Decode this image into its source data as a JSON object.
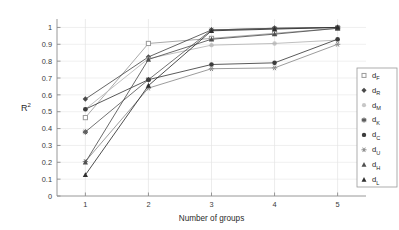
{
  "chart_data": {
    "type": "line",
    "title": "",
    "xlabel": "Number of groups",
    "ylabel": "R^2",
    "ylabel_base": "R",
    "ylabel_exp": "2",
    "x": [
      1,
      2,
      3,
      4,
      5
    ],
    "xticklabels": [
      "1",
      "2",
      "3",
      "4",
      "5"
    ],
    "yticklabels": [
      "0",
      "0.1",
      "0.2",
      "0.3",
      "0.4",
      "0.5",
      "0.6",
      "0.7",
      "0.8",
      "0.9",
      "1"
    ],
    "yticks": [
      0,
      0.1,
      0.2,
      0.3,
      0.4,
      0.5,
      0.6,
      0.7,
      0.8,
      0.9,
      1.0
    ],
    "xlim": [
      0.55,
      5.45
    ],
    "ylim": [
      0,
      1.05
    ],
    "grid": true,
    "legend_position": "right-inside",
    "series": [
      {
        "name": "d_F",
        "label_base": "d",
        "label_sub": "F",
        "marker": "square",
        "color": "#9a9a9a",
        "values": [
          0.465,
          0.905,
          0.935,
          0.965,
          0.995
        ]
      },
      {
        "name": "d_R",
        "label_base": "d",
        "label_sub": "R",
        "marker": "diamond",
        "color": "#4a4a4a",
        "values": [
          0.575,
          0.825,
          0.985,
          0.995,
          1.0
        ]
      },
      {
        "name": "d_M",
        "label_base": "d",
        "label_sub": "M",
        "marker": "circle-open",
        "color": "#b4b4b4",
        "values": [
          0.515,
          0.815,
          0.895,
          0.905,
          0.925
        ]
      },
      {
        "name": "d_K",
        "label_base": "d",
        "label_sub": "K",
        "marker": "star",
        "color": "#5a5a5a",
        "values": [
          0.38,
          0.69,
          0.985,
          0.995,
          1.0
        ]
      },
      {
        "name": "d_C",
        "label_base": "d",
        "label_sub": "C",
        "marker": "circle-filled",
        "color": "#3c3c3c",
        "values": [
          0.515,
          0.69,
          0.78,
          0.79,
          0.93
        ]
      },
      {
        "name": "d_U",
        "label_base": "d",
        "label_sub": "U",
        "marker": "plus",
        "color": "#8a8a8a",
        "values": [
          0.205,
          0.64,
          0.755,
          0.76,
          0.9
        ]
      },
      {
        "name": "d_H",
        "label_base": "d",
        "label_sub": "H",
        "marker": "triangle",
        "color": "#4f4f4f",
        "values": [
          0.2,
          0.81,
          0.93,
          0.96,
          0.995
        ]
      },
      {
        "name": "d_L",
        "label_base": "d",
        "label_sub": "L",
        "marker": "triangle",
        "color": "#2e2e2e",
        "values": [
          0.125,
          0.655,
          0.98,
          0.99,
          1.0
        ]
      }
    ]
  }
}
